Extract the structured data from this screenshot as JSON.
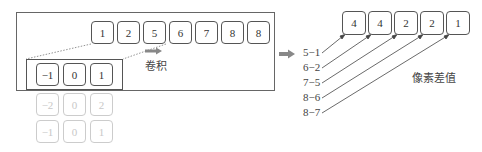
{
  "input_row": {
    "values": [
      "1",
      "2",
      "5",
      "6",
      "7",
      "8",
      "8"
    ]
  },
  "kernel": {
    "rows": [
      [
        "−1",
        "0",
        "1"
      ],
      [
        "−2",
        "0",
        "2"
      ],
      [
        "−1",
        "0",
        "1"
      ]
    ],
    "active_row_index": 0
  },
  "convolution_label": "卷积",
  "output_row": {
    "values": [
      "4",
      "4",
      "2",
      "2",
      "1"
    ]
  },
  "differences": [
    "5−1",
    "6−2",
    "7−5",
    "8−6",
    "8−7"
  ],
  "output_label": "像素差值",
  "colors": {
    "line": "#555555",
    "arrow": "#888888",
    "faded": "#cccccc"
  }
}
